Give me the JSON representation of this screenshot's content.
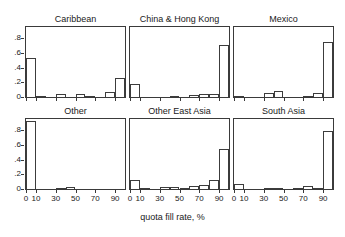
{
  "chart_data": {
    "type": "bar",
    "title": "",
    "xlabel": "quota fill rate, %",
    "ylabel": "",
    "xlim": [
      0,
      100
    ],
    "ylim": [
      0,
      0.95
    ],
    "grid": false,
    "legend": null,
    "layout": "2 rows x 3 columns of small-multiple histograms",
    "xticks": [
      "0",
      "10",
      "30",
      "50",
      "70",
      "90"
    ],
    "xtick_values": [
      0,
      10,
      30,
      50,
      70,
      90
    ],
    "yticks": [
      "0",
      ".2",
      ".4",
      ".6",
      ".8"
    ],
    "ytick_values": [
      0,
      0.2,
      0.4,
      0.6,
      0.8
    ],
    "bin_width": 10,
    "bin_starts": [
      0,
      10,
      20,
      30,
      40,
      50,
      60,
      70,
      80,
      90
    ],
    "panels": [
      {
        "title": "Caribbean",
        "row": 0,
        "col": 0,
        "values": [
          0.53,
          0.01,
          0.0,
          0.04,
          0.0,
          0.04,
          0.02,
          0.0,
          0.07,
          0.26
        ]
      },
      {
        "title": "China & Hong Kong",
        "row": 0,
        "col": 1,
        "values": [
          0.17,
          0.0,
          0.0,
          0.0,
          0.01,
          0.0,
          0.03,
          0.04,
          0.04,
          0.7
        ]
      },
      {
        "title": "Mexico",
        "row": 0,
        "col": 2,
        "values": [
          0.01,
          0.0,
          0.0,
          0.05,
          0.08,
          0.0,
          0.0,
          0.02,
          0.06,
          0.74
        ]
      },
      {
        "title": "Other",
        "row": 1,
        "col": 0,
        "values": [
          0.92,
          0.0,
          0.0,
          0.01,
          0.03,
          0.0,
          0.0,
          0.0,
          0.0,
          0.0
        ]
      },
      {
        "title": "Other East Asia",
        "row": 1,
        "col": 1,
        "values": [
          0.12,
          0.01,
          0.0,
          0.03,
          0.03,
          0.02,
          0.04,
          0.05,
          0.12,
          0.54
        ]
      },
      {
        "title": "South Asia",
        "row": 1,
        "col": 2,
        "values": [
          0.07,
          0.0,
          0.0,
          0.01,
          0.01,
          0.0,
          0.02,
          0.04,
          0.01,
          0.79
        ]
      }
    ]
  }
}
